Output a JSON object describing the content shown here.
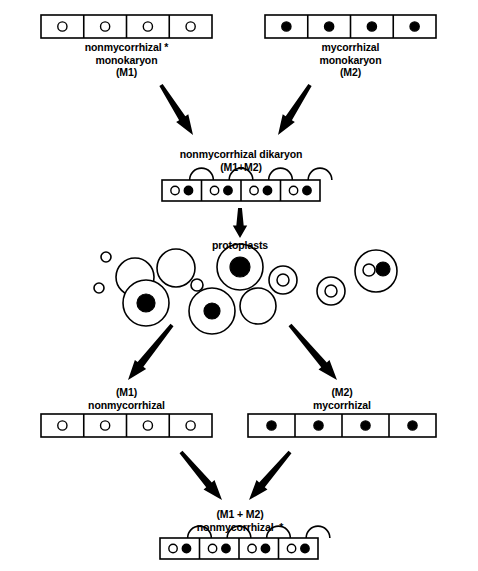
{
  "figure": {
    "title_present": false,
    "background_color": "#ffffff",
    "ink_color": "#000000"
  },
  "labels": {
    "top_left": "nonmycorrhizal *\nmonokaryon\n(M1)",
    "top_right": "mycorrhizal\nmonokaryon\n(M2)",
    "dikaryon": "nonmycorrhizal dikaryon\n(M1+M2)",
    "protoplasts": "protoplasts",
    "bottom_left": "(M1)\nnonmycorrhizal",
    "bottom_right": "(M2)\nmycorrhizal",
    "final": "(M1 + M2)\nnonmycorrhizal  *"
  },
  "hyphae": [
    {
      "id": "top-left-monokaryon-hypha",
      "x": 41,
      "y": 15,
      "width": 171,
      "height": 23,
      "cells": 4,
      "nuclei_per_cell": [
        "open"
      ],
      "clamps": false
    },
    {
      "id": "top-right-monokaryon-hypha",
      "x": 265,
      "y": 15,
      "width": 171,
      "height": 23,
      "cells": 4,
      "nuclei_per_cell": [
        "filled"
      ],
      "clamps": false
    },
    {
      "id": "dikaryon-hypha",
      "x": 162,
      "y": 180,
      "width": 158,
      "height": 21,
      "cells": 4,
      "nuclei_per_cell": [
        "open",
        "filled"
      ],
      "clamps": true
    },
    {
      "id": "bottom-left-monokaryon-hypha",
      "x": 41,
      "y": 414,
      "width": 171,
      "height": 23,
      "cells": 4,
      "nuclei_per_cell": [
        "open"
      ],
      "clamps": false
    },
    {
      "id": "bottom-right-monokaryon-hypha",
      "x": 248,
      "y": 414,
      "width": 188,
      "height": 23,
      "cells": 4,
      "nuclei_per_cell": [
        "filled"
      ],
      "clamps": false
    },
    {
      "id": "final-dikaryon-hypha",
      "x": 160,
      "y": 538,
      "width": 158,
      "height": 21,
      "cells": 4,
      "nuclei_per_cell": [
        "open",
        "filled"
      ],
      "clamps": true
    }
  ],
  "protoplasts": [
    {
      "cx": 106,
      "cy": 257,
      "r": 5,
      "nucleus": "none"
    },
    {
      "cx": 99,
      "cy": 288,
      "r": 5,
      "nucleus": "none"
    },
    {
      "cx": 135,
      "cy": 277,
      "r": 19,
      "nucleus": "none"
    },
    {
      "cx": 146,
      "cy": 303,
      "r": 23,
      "nucleus": "filled",
      "nr": 9
    },
    {
      "cx": 176,
      "cy": 268,
      "r": 19,
      "nucleus": "none"
    },
    {
      "cx": 197,
      "cy": 285,
      "r": 6,
      "nucleus": "none"
    },
    {
      "cx": 212,
      "cy": 311,
      "r": 23,
      "nucleus": "filled",
      "nr": 8
    },
    {
      "cx": 240,
      "cy": 267,
      "r": 23,
      "nucleus": "filled",
      "nr": 10
    },
    {
      "cx": 258,
      "cy": 306,
      "r": 18,
      "nucleus": "none"
    },
    {
      "cx": 283,
      "cy": 280,
      "r": 14,
      "nucleus": "open",
      "nr": 6
    },
    {
      "cx": 331,
      "cy": 291,
      "r": 14,
      "nucleus": "open",
      "nr": 6
    },
    {
      "cx": 376,
      "cy": 271,
      "r": 21,
      "nucleus": "pair",
      "nr": 6
    }
  ],
  "arrows": [
    {
      "id": "arrow-m1-to-dikaryon",
      "x1": 161,
      "y1": 85,
      "x2": 193,
      "y2": 135
    },
    {
      "id": "arrow-m2-to-dikaryon",
      "x1": 310,
      "y1": 85,
      "x2": 278,
      "y2": 135
    },
    {
      "id": "arrow-dikaryon-to-proto",
      "x1": 240,
      "y1": 208,
      "x2": 240,
      "y2": 238
    },
    {
      "id": "arrow-proto-to-m1",
      "x1": 172,
      "y1": 325,
      "x2": 128,
      "y2": 380
    },
    {
      "id": "arrow-proto-to-m2",
      "x1": 290,
      "y1": 325,
      "x2": 337,
      "y2": 380
    },
    {
      "id": "arrow-m1-to-final",
      "x1": 181,
      "y1": 452,
      "x2": 222,
      "y2": 500
    },
    {
      "id": "arrow-m2-to-final",
      "x1": 290,
      "y1": 452,
      "x2": 249,
      "y2": 500
    }
  ],
  "caption_positions": {
    "top_left": {
      "x": 41,
      "y": 41,
      "width": 171
    },
    "top_right": {
      "x": 265,
      "y": 41,
      "width": 171
    },
    "dikaryon": {
      "x": 160,
      "y": 148,
      "width": 162
    },
    "protoplasts": {
      "x": 190,
      "y": 239,
      "width": 100
    },
    "bottom_left": {
      "x": 41,
      "y": 386,
      "width": 171
    },
    "bottom_right": {
      "x": 248,
      "y": 386,
      "width": 188
    },
    "final": {
      "x": 159,
      "y": 508,
      "width": 162
    }
  }
}
